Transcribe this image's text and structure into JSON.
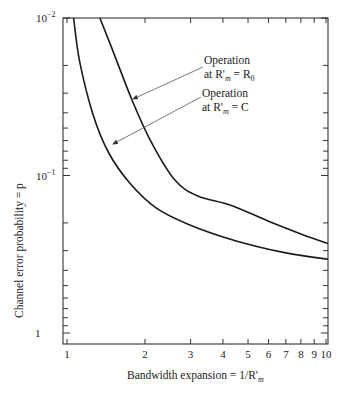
{
  "chart_data": {
    "type": "line",
    "title": "",
    "xlabel": "Bandwidth expansion = 1/R'_m",
    "ylabel": "Channel error probability = p",
    "xscale": "log",
    "yscale": "log",
    "y_inverted": true,
    "xlim": [
      0.95,
      10.2
    ],
    "ylim": [
      0.01,
      1.17
    ],
    "x_ticks": [
      "1",
      "2",
      "3",
      "4",
      "5",
      "6",
      "7",
      "8",
      "9",
      "10"
    ],
    "y_ticks": [
      "10^-2",
      "10^-1",
      "1"
    ],
    "grid": false,
    "legend": null,
    "series": [
      {
        "name": "Operation at R'_m = R_0",
        "x": [
          1.34,
          1.5,
          1.78,
          2.1,
          2.61,
          3.2,
          4.26,
          6.0,
          8.0,
          10.2
        ],
        "y": [
          0.01,
          0.016,
          0.033,
          0.06,
          0.107,
          0.135,
          0.154,
          0.195,
          0.235,
          0.27
        ]
      },
      {
        "name": "Operation at R'_m = C",
        "x": [
          1.06,
          1.12,
          1.26,
          1.45,
          1.75,
          2.2,
          2.98,
          4.5,
          7.0,
          10.2
        ],
        "y": [
          0.01,
          0.019,
          0.041,
          0.072,
          0.112,
          0.16,
          0.206,
          0.26,
          0.31,
          0.34
        ]
      }
    ],
    "annotations": [
      {
        "line1": "Operation",
        "line2_prefix": "at R'",
        "line2_sub": "m",
        "line2_suffix": " = R",
        "line2_sub2": "0",
        "target_series": 0
      },
      {
        "line1": "Operation",
        "line2_prefix": "at R'",
        "line2_sub": "m",
        "line2_suffix": " = C",
        "line2_sub2": "",
        "target_series": 1
      }
    ]
  },
  "labels": {
    "y_title": "Channel error probability = p",
    "x_title_prefix": "Bandwidth expansion = 1/R'",
    "x_title_sub": "m",
    "y_tick_top_base": "10",
    "y_tick_top_exp": "−2",
    "y_tick_mid_base": "10",
    "y_tick_mid_exp": "−1",
    "y_tick_bottom": "1",
    "ann1_line1": "Operation",
    "ann1_line2a": "at R'",
    "ann1_line2_sub": "m",
    "ann1_line2b": " = R",
    "ann1_line2_sub2": "0",
    "ann2_line1": "Operation",
    "ann2_line2a": "at R'",
    "ann2_line2_sub": "m",
    "ann2_line2b": " = C"
  },
  "colors": {
    "curve": "#1a1a1a",
    "arrow": "#555555",
    "axis": "#333333"
  }
}
